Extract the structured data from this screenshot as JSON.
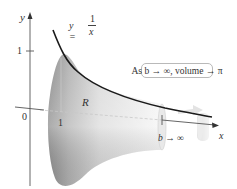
{
  "figure": {
    "axes": {
      "x_label": "x",
      "y_label": "y",
      "origin_label": "0",
      "x_tick_label": "1",
      "y_tick_label": "1"
    },
    "curve": {
      "equation_lhs": "y =",
      "numerator": "1",
      "denominator": "x"
    },
    "region_label": "R",
    "limit_label": "b → ∞",
    "callout": "As b → ∞, volume → π",
    "colors": {
      "curve": "#1a1a1a",
      "solid_light": "#f2f2f2",
      "solid_dark": "#9a9a9a",
      "axis": "#555555",
      "callout_border": "#b9b9b9",
      "arrow_ghost": "#e6e6e6"
    }
  }
}
